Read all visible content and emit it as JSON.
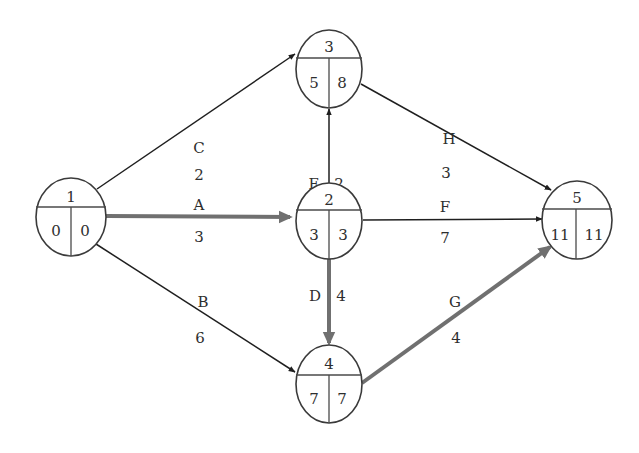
{
  "diagram": {
    "type": "activity-on-arrow network (critical path)",
    "colors": {
      "normal_edge": "#1f1f1f",
      "critical_edge": "#707070",
      "node_stroke": "#3a3a3a",
      "text": "#2e2e2e"
    },
    "nodes": [
      {
        "id": "1",
        "label": "1",
        "early": "0",
        "late": "0"
      },
      {
        "id": "2",
        "label": "2",
        "early": "3",
        "late": "3"
      },
      {
        "id": "3",
        "label": "3",
        "early": "5",
        "late": "8"
      },
      {
        "id": "4",
        "label": "4",
        "early": "7",
        "late": "7"
      },
      {
        "id": "5",
        "label": "5",
        "early": "11",
        "late": "11"
      }
    ],
    "edges": [
      {
        "activity": "A",
        "duration": "3",
        "from": "1",
        "to": "2",
        "critical": true
      },
      {
        "activity": "B",
        "duration": "6",
        "from": "1",
        "to": "4",
        "critical": false
      },
      {
        "activity": "C",
        "duration": "2",
        "from": "1",
        "to": "3",
        "critical": false
      },
      {
        "activity": "D",
        "duration": "4",
        "from": "2",
        "to": "4",
        "critical": true
      },
      {
        "activity": "E",
        "duration": "2",
        "from": "2",
        "to": "3",
        "critical": false
      },
      {
        "activity": "F",
        "duration": "7",
        "from": "2",
        "to": "5",
        "critical": false
      },
      {
        "activity": "G",
        "duration": "4",
        "from": "4",
        "to": "5",
        "critical": true
      },
      {
        "activity": "H",
        "duration": "3",
        "from": "3",
        "to": "5",
        "critical": false
      }
    ]
  }
}
